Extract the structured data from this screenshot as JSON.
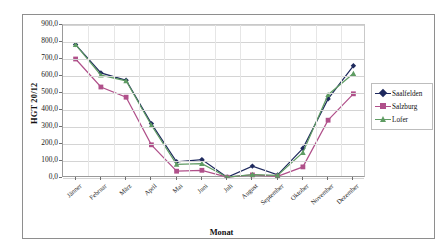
{
  "chart_data": {
    "type": "line",
    "title": "",
    "xlabel": "Monat",
    "ylabel": "HGT 20/12",
    "categories": [
      "Jänner",
      "Februar",
      "März",
      "April",
      "Mai",
      "Juni",
      "Juli",
      "August",
      "September",
      "Oktober",
      "November",
      "Dezember"
    ],
    "ylim": [
      0,
      900
    ],
    "ytick_labels": [
      "900,0",
      "800,0",
      "700,0",
      "600,0",
      "500,0",
      "400,0",
      "300,0",
      "200,0",
      "100,0",
      "0,0"
    ],
    "ytick_values": [
      900,
      800,
      700,
      600,
      500,
      400,
      300,
      200,
      100,
      0
    ],
    "grid": true,
    "legend_position": "right",
    "series": [
      {
        "name": "Saalfelden",
        "color": "#1f2a5e",
        "marker": "diamond",
        "values": [
          785,
          618,
          575,
          320,
          95,
          108,
          5,
          70,
          18,
          175,
          465,
          660
        ]
      },
      {
        "name": "Salzburg",
        "color": "#b0508a",
        "marker": "square",
        "values": [
          700,
          535,
          475,
          195,
          40,
          45,
          5,
          18,
          10,
          65,
          340,
          495
        ]
      },
      {
        "name": "Lofer",
        "color": "#5f9c63",
        "marker": "triangle",
        "values": [
          785,
          605,
          572,
          310,
          80,
          85,
          5,
          20,
          15,
          150,
          490,
          615
        ]
      }
    ]
  },
  "legend": {
    "items": [
      {
        "label": "Saalfelden"
      },
      {
        "label": "Salzburg"
      },
      {
        "label": "Lofer"
      }
    ]
  },
  "axes": {
    "y_title": "HGT 20/12",
    "x_title": "Monat"
  }
}
